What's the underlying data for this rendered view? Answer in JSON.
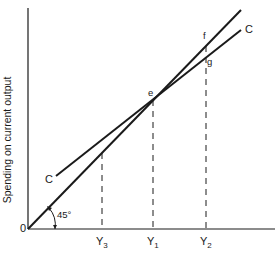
{
  "diagram": {
    "y_axis_label": "Spending on current output",
    "origin_label": "0",
    "angle_label": "45°",
    "lines": {
      "forty_five_degree_line": {
        "description": "45-degree line from origin"
      },
      "consumption_line": {
        "label_start": "C",
        "label_end": "C"
      }
    },
    "points": {
      "e": "e",
      "f": "f",
      "g": "g"
    },
    "x_ticks": [
      {
        "main": "Y",
        "sub": "3"
      },
      {
        "main": "Y",
        "sub": "1"
      },
      {
        "main": "Y",
        "sub": "2"
      }
    ],
    "colors": {
      "line": "#1a1a1a",
      "background": "#ffffff"
    }
  }
}
